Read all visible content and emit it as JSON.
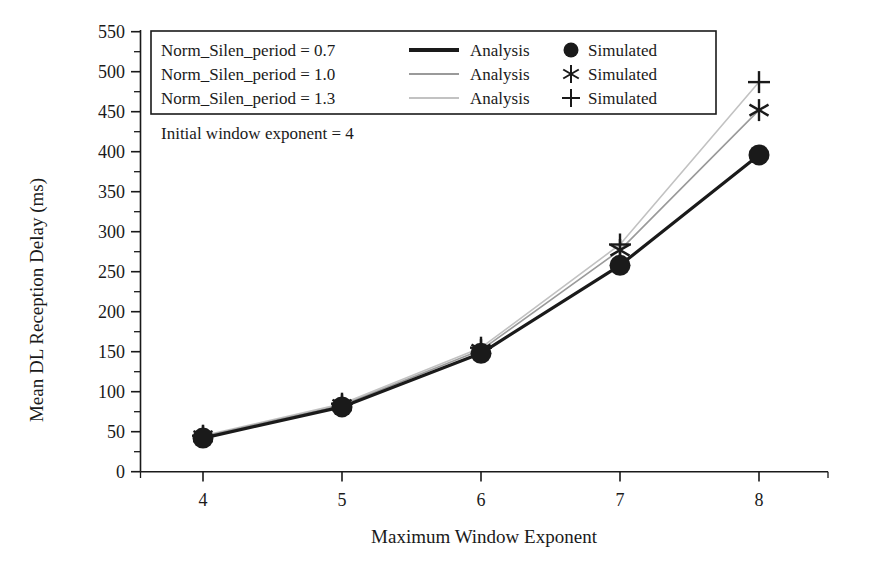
{
  "chart_data": {
    "type": "line",
    "title": "",
    "xlabel": "Maximum Window Exponent",
    "ylabel": "Mean DL Reception Delay (ms)",
    "x": [
      4,
      5,
      6,
      7,
      8
    ],
    "xlim": [
      3.6,
      8.4
    ],
    "ylim": [
      0,
      550
    ],
    "xticks": [
      4,
      5,
      6,
      7,
      8
    ],
    "xtick_labels": [
      "4",
      "5",
      "6",
      "7",
      "8"
    ],
    "yticks": [
      0,
      50,
      100,
      150,
      200,
      250,
      300,
      350,
      400,
      450,
      500,
      550
    ],
    "ytick_labels": [
      "0",
      "50",
      "100",
      "150",
      "200",
      "250",
      "300",
      "350",
      "400",
      "450",
      "500",
      "550"
    ],
    "y_minor_tick_step": 25,
    "grid": false,
    "legend_position": "upper-left",
    "series": [
      {
        "name": "Norm_Silen_period = 0.7",
        "line_label": "Analysis",
        "marker_label": "Simulated",
        "marker": "circle",
        "color": "#1a1a1a",
        "line_width": 3.2,
        "values": [
          42,
          81,
          148,
          258,
          396
        ]
      },
      {
        "name": "Norm_Silen_period = 1.0",
        "line_label": "Analysis",
        "marker_label": "Simulated",
        "marker": "asterisk",
        "color": "#9a9a9a",
        "line_width": 1.6,
        "values": [
          44,
          83,
          152,
          277,
          452
        ]
      },
      {
        "name": "Norm_Silen_period = 1.3",
        "line_label": "Analysis",
        "marker_label": "Simulated",
        "marker": "plus",
        "color": "#c2c2c2",
        "line_width": 1.6,
        "values": [
          45,
          85,
          155,
          284,
          487
        ]
      }
    ],
    "annotations": [
      {
        "text": "Initial window exponent = 4"
      }
    ]
  },
  "legend": {
    "rows": [
      {
        "series_label": "Norm_Silen_period = 0.7",
        "line_label": "Analysis",
        "marker_label": "Simulated",
        "marker_icon": "filled-circle-marker",
        "line_color": "#1a1a1a"
      },
      {
        "series_label": "Norm_Silen_period = 1.0",
        "line_label": "Analysis",
        "marker_label": "Simulated",
        "marker_icon": "asterisk-marker",
        "line_color": "#9a9a9a"
      },
      {
        "series_label": "Norm_Silen_period = 1.3",
        "line_label": "Analysis",
        "marker_label": "Simulated",
        "marker_icon": "plus-marker",
        "line_color": "#c2c2c2"
      }
    ]
  },
  "annotation": {
    "initial_window": "Initial window exponent = 4"
  }
}
